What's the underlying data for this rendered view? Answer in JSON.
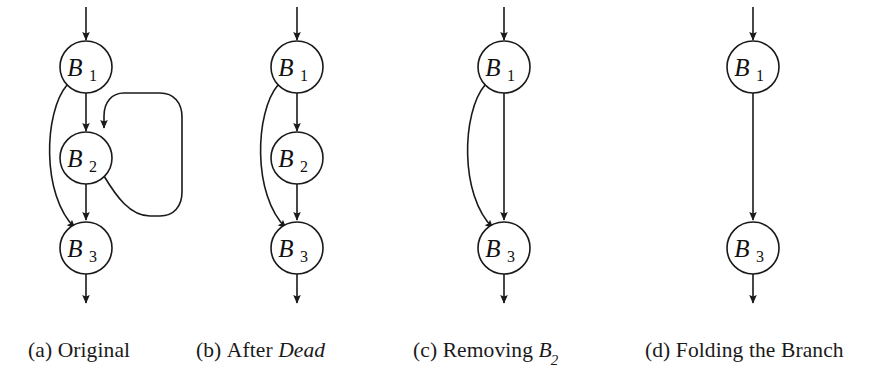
{
  "figure": {
    "background_color": "#ffffff",
    "stroke_color": "#1a1a1a",
    "node_fill_color": "#ffffff",
    "text_color": "#1a1a1a",
    "kind": "control-flow-graph-sequence",
    "panel_count": 4
  },
  "panels": [
    {
      "id": "a",
      "caption_prefix": "(a)",
      "caption_text": "Original",
      "caption_emphasis": "",
      "caption_var": "",
      "caption_sub": "",
      "nodes": [
        {
          "id": "B1",
          "letter": "B",
          "subscript": "1",
          "cx": 86,
          "cy": 67,
          "r": 26
        },
        {
          "id": "B2",
          "letter": "B",
          "subscript": "2",
          "cx": 86,
          "cy": 158,
          "r": 26
        },
        {
          "id": "B3",
          "letter": "B",
          "subscript": "3",
          "cx": 86,
          "cy": 248,
          "r": 26
        }
      ],
      "edges": [
        {
          "from": "entry",
          "to": "B1",
          "style": "straight"
        },
        {
          "from": "B1",
          "to": "B2",
          "style": "straight"
        },
        {
          "from": "B1",
          "to": "B3",
          "style": "curve-left"
        },
        {
          "from": "B2",
          "to": "B3",
          "style": "straight"
        },
        {
          "from": "B2",
          "to": "B2",
          "style": "loop-right-back-edge"
        },
        {
          "from": "B3",
          "to": "exit",
          "style": "straight"
        }
      ]
    },
    {
      "id": "b",
      "caption_prefix": "(b)",
      "caption_text": "After",
      "caption_emphasis": "Dead",
      "caption_var": "",
      "caption_sub": "",
      "nodes": [
        {
          "id": "B1",
          "letter": "B",
          "subscript": "1",
          "cx": 297,
          "cy": 67,
          "r": 26
        },
        {
          "id": "B2",
          "letter": "B",
          "subscript": "2",
          "cx": 297,
          "cy": 158,
          "r": 26
        },
        {
          "id": "B3",
          "letter": "B",
          "subscript": "3",
          "cx": 297,
          "cy": 248,
          "r": 26
        }
      ],
      "edges": [
        {
          "from": "entry",
          "to": "B1",
          "style": "straight"
        },
        {
          "from": "B1",
          "to": "B2",
          "style": "straight"
        },
        {
          "from": "B1",
          "to": "B3",
          "style": "curve-left"
        },
        {
          "from": "B2",
          "to": "B3",
          "style": "straight"
        },
        {
          "from": "B3",
          "to": "exit",
          "style": "straight"
        }
      ]
    },
    {
      "id": "c",
      "caption_prefix": "(c)",
      "caption_text": "Removing",
      "caption_emphasis": "",
      "caption_var": "B",
      "caption_sub": "2",
      "nodes": [
        {
          "id": "B1",
          "letter": "B",
          "subscript": "1",
          "cx": 504,
          "cy": 67,
          "r": 26
        },
        {
          "id": "B3",
          "letter": "B",
          "subscript": "3",
          "cx": 504,
          "cy": 248,
          "r": 26
        }
      ],
      "edges": [
        {
          "from": "entry",
          "to": "B1",
          "style": "straight"
        },
        {
          "from": "B1",
          "to": "B3",
          "style": "straight"
        },
        {
          "from": "B1",
          "to": "B3",
          "style": "curve-left"
        },
        {
          "from": "B3",
          "to": "exit",
          "style": "straight"
        }
      ]
    },
    {
      "id": "d",
      "caption_prefix": "(d)",
      "caption_text": "Folding the Branch",
      "caption_emphasis": "",
      "caption_var": "",
      "caption_sub": "",
      "nodes": [
        {
          "id": "B1",
          "letter": "B",
          "subscript": "1",
          "cx": 753,
          "cy": 67,
          "r": 26
        },
        {
          "id": "B3",
          "letter": "B",
          "subscript": "3",
          "cx": 753,
          "cy": 248,
          "r": 26
        }
      ],
      "edges": [
        {
          "from": "entry",
          "to": "B1",
          "style": "straight"
        },
        {
          "from": "B1",
          "to": "B3",
          "style": "straight"
        },
        {
          "from": "B3",
          "to": "exit",
          "style": "straight"
        }
      ]
    }
  ],
  "captions": {
    "a": {
      "prefix": "(a)",
      "main": "Original",
      "em": "",
      "var": "",
      "sub": "",
      "left": 28
    },
    "b": {
      "prefix": "(b)",
      "main": "After",
      "em": "Dead",
      "var": "",
      "sub": "",
      "left": 196
    },
    "c": {
      "prefix": "(c)",
      "main": "Removing",
      "em": "",
      "var": "B",
      "sub": "2",
      "left": 413
    },
    "d": {
      "prefix": "(d)",
      "main": "Folding the Branch",
      "em": "",
      "var": "",
      "sub": "",
      "left": 645
    }
  }
}
